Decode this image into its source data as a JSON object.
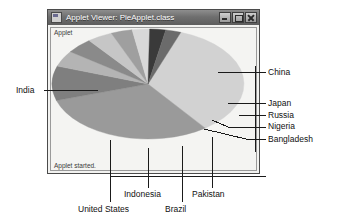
{
  "window": {
    "title": "Applet Viewer: PieApplet.class",
    "app_icon": "applet-icon",
    "buttons": {
      "minimize": "minimize-icon",
      "maximize": "maximize-icon",
      "close": "close-icon"
    },
    "applet_label": "Applet",
    "status": "Applet started."
  },
  "chart_data": {
    "type": "pie",
    "title": "",
    "legend_position": "callout-labels",
    "labels": [
      "China",
      "India",
      "United States",
      "Indonesia",
      "Brazil",
      "Pakistan",
      "Bangladesh",
      "Nigeria",
      "Russia",
      "Japan"
    ],
    "categories": [
      "China",
      "India",
      "United States",
      "Indonesia",
      "Brazil",
      "Pakistan",
      "Bangladesh",
      "Nigeria",
      "Russia",
      "Japan"
    ],
    "values": [
      30.5,
      27.0,
      9.0,
      4.2,
      4.0,
      3.8,
      3.2,
      2.6,
      2.4,
      2.3
    ],
    "colors": [
      "#d2d2d2",
      "#9a9a9a",
      "#7f7f7f",
      "#b4b4b4",
      "#8a8a8a",
      "#c6c6c6",
      "#9f9f9f",
      "#d8d8d8",
      "#3a3a3a",
      "#6b6b6b"
    ],
    "callouts": [
      {
        "label": "China",
        "side": "right"
      },
      {
        "label": "Japan",
        "side": "right"
      },
      {
        "label": "Russia",
        "side": "right"
      },
      {
        "label": "Nigeria",
        "side": "right"
      },
      {
        "label": "Bangladesh",
        "side": "right"
      },
      {
        "label": "India",
        "side": "left"
      },
      {
        "label": "United States",
        "side": "bottom"
      },
      {
        "label": "Indonesia",
        "side": "bottom"
      },
      {
        "label": "Brazil",
        "side": "bottom"
      },
      {
        "label": "Pakistan",
        "side": "bottom"
      }
    ]
  },
  "labels": {
    "china": "China",
    "japan": "Japan",
    "russia": "Russia",
    "nigeria": "Nigeria",
    "bangladesh": "Bangladesh",
    "india": "India",
    "united_states": "United States",
    "indonesia": "Indonesia",
    "brazil": "Brazil",
    "pakistan": "Pakistan"
  }
}
